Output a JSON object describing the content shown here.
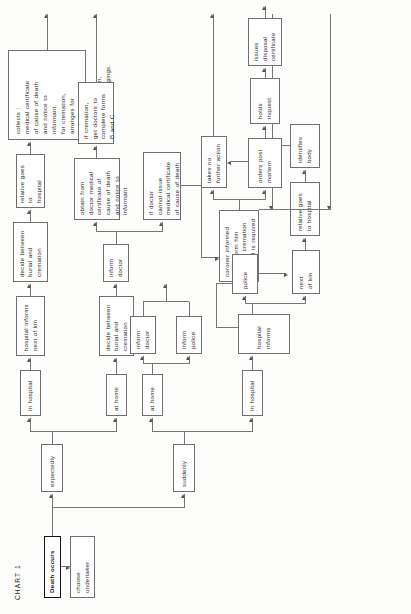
{
  "chart": {
    "title": "CHART 1",
    "orientation": "landscape-rotated-90ccw",
    "nodes": {
      "death_occurs": "Death occurs",
      "choose_undertaker": "choose\nundertaker",
      "expectedly": "expectedly",
      "suddenly": "suddenly",
      "at_home_exp": "at home",
      "in_hospital_exp": "in hospital",
      "at_home_sud": "at home",
      "in_hospital_sud": "in hospital",
      "decide_home": "decide between\nburial and\ncremation",
      "decide_hosp": "decide between\nburial and\ncremation",
      "hospital_informs_kin": "hospital informs\nnext of kin",
      "relative_goes_hospital_top": "relative goes to\nhospital",
      "collects": "collects :\nmedical certificate\nof cause of death\nand notice to\ninformant.\nfor cremation,\narranges for\nforms B and C.\nif asked,decides\nabout post mortem,\ntakes away belongings.",
      "inform_doctor_exp": "inform\ndoctor",
      "inform_doctor_sud": "inform\ndoctor",
      "inform_police": "inform\npolice",
      "obtain_from_doctor": "obtain from\ndoctor medical\ncertificate of\ncause of death\nand notice to\ninformant",
      "if_cremation_forms": "if cremation,\nget doctors to\ncomplete forms\nB and C",
      "if_doctor_cannot": "if doctor\ncannot issue\nmedical certificate\nof cause of death",
      "coroner_informed": "coroner informed\nalso inform him\nwhether cremation\nor burial is required",
      "hospital_informs": "hospital informs",
      "police": "police",
      "next_of_kin": "next\nof kin",
      "relative_goes_hospital": "relative goes\nto hospital",
      "identifies_body": "identifies\nbody",
      "takes_no_further_action": "takes no\nfurther action",
      "orders_post_mortem": "orders post\nmortem",
      "holds_inquest": "holds inquest",
      "issues_disposal_certificate": "issues disposal\ncertificate"
    },
    "colors": {
      "ink": "#2b2b2b",
      "box_border": "#6f6f6f",
      "emphasis_border": "#141414",
      "connector": "#767676",
      "paper": "#fdfdfc"
    }
  }
}
